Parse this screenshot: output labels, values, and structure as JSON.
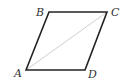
{
  "diagram": {
    "type": "parallelogram",
    "vertices": {
      "A": {
        "label": "A",
        "x": 26,
        "y": 70,
        "lx": 14,
        "ly": 77
      },
      "B": {
        "label": "B",
        "x": 49,
        "y": 12,
        "lx": 36,
        "ly": 16
      },
      "C": {
        "label": "C",
        "x": 107,
        "y": 12,
        "lx": 111,
        "ly": 16
      },
      "D": {
        "label": "D",
        "x": 85,
        "y": 70,
        "lx": 88,
        "ly": 78
      }
    },
    "edges": [
      [
        "A",
        "B"
      ],
      [
        "B",
        "C"
      ],
      [
        "C",
        "D"
      ],
      [
        "D",
        "A"
      ]
    ],
    "diagonals": [
      [
        "A",
        "C"
      ]
    ],
    "colors": {
      "edge": "#222222",
      "diagonal": "#c8c8c8",
      "label": "#333333"
    }
  }
}
